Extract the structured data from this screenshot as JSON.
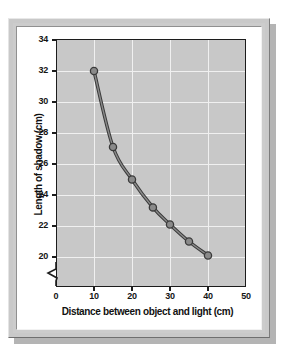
{
  "figure": {
    "frame_color": "#c9c9c9",
    "panel_color": "#c8c8c8",
    "grid_color": "#f0f0f0",
    "axis_color": "#1c1c1c",
    "series_color": "#8a8a8a",
    "series_outline_color": "#3a3a3a"
  },
  "chart_data": {
    "type": "line",
    "title": "",
    "xlabel": "Distance between object and light (cm)",
    "ylabel": "Length of shadow (cm)",
    "xlim": [
      0,
      50
    ],
    "ylim": [
      19,
      34
    ],
    "xticks": [
      0,
      10,
      20,
      30,
      40,
      50
    ],
    "yticks": [
      20,
      22,
      24,
      26,
      28,
      30,
      32,
      34
    ],
    "xtick_labels": [
      "0",
      "10",
      "20",
      "30",
      "40",
      "50"
    ],
    "ytick_labels": [
      "20",
      "22",
      "24",
      "26",
      "28",
      "30",
      "32",
      "34"
    ],
    "grid": true,
    "legend": "none",
    "y_axis_break": true,
    "markers": "circle",
    "x": [
      10,
      15,
      20,
      25.5,
      30,
      35,
      40
    ],
    "values": [
      32.0,
      27.1,
      25.0,
      23.2,
      22.1,
      21.0,
      20.1
    ],
    "series": [
      {
        "name": "Length of shadow",
        "points": [
          {
            "x": 10,
            "y": 32.0
          },
          {
            "x": 15,
            "y": 27.1
          },
          {
            "x": 20,
            "y": 25.0
          },
          {
            "x": 25.5,
            "y": 23.2
          },
          {
            "x": 30,
            "y": 22.1
          },
          {
            "x": 35,
            "y": 21.0
          },
          {
            "x": 40,
            "y": 20.1
          }
        ]
      }
    ],
    "annotations": []
  }
}
